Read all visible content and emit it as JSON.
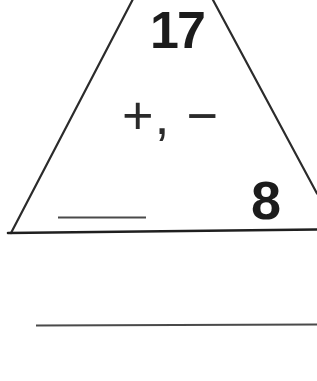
{
  "worksheet": {
    "description": "fact family triangle flash card",
    "triangle_card": {
      "top_value": "17",
      "operations": "+, −",
      "right_value": "8",
      "left_value_blank": ""
    },
    "colors": {
      "ink": "#1c1c1c",
      "triangle_line": "#2b2b2b",
      "base_line": "#1f1f1f",
      "writing_line": "#4a4a4a",
      "paper": "#ffffff"
    }
  }
}
